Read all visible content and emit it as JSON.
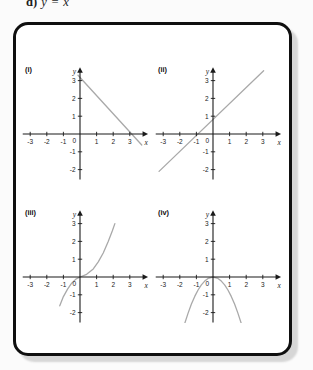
{
  "heading": {
    "prefix": "d)",
    "formula": "y = x"
  },
  "colors": {
    "page_bg": "#fbfbfb",
    "panel_bg": "#ffffff",
    "panel_border": "#0f0f0f",
    "shadow": "#d6d6d6",
    "axis": "#1a1a1a",
    "tick_label": "#222222",
    "curve": "#a9a9a9"
  },
  "chart_data": [
    {
      "id": "i",
      "label": "(i)",
      "type": "line",
      "x_axis_label": "x",
      "y_axis_label": "y",
      "origin_label": "0",
      "x_ticks": [
        -3,
        -2,
        -1,
        1,
        2,
        3
      ],
      "y_ticks": [
        -2,
        -1,
        1,
        2,
        3
      ],
      "x_range": [
        -3.45,
        4.1
      ],
      "y_range": [
        -2.55,
        3.75
      ],
      "grid": false,
      "curve_points": [
        [
          -0.12,
          3.3
        ],
        [
          3.72,
          -0.62
        ]
      ]
    },
    {
      "id": "ii",
      "label": "(ii)",
      "type": "line",
      "x_axis_label": "x",
      "y_axis_label": "y",
      "origin_label": "0",
      "x_ticks": [
        -3,
        -2,
        -1,
        1,
        2,
        3
      ],
      "y_ticks": [
        -2,
        -1,
        1,
        2,
        3
      ],
      "x_range": [
        -3.45,
        4.1
      ],
      "y_range": [
        -2.55,
        3.75
      ],
      "grid": false,
      "curve_points": [
        [
          -3.25,
          -2.1
        ],
        [
          3.05,
          3.55
        ]
      ]
    },
    {
      "id": "iii",
      "label": "(iii)",
      "type": "line",
      "x_axis_label": "x",
      "y_axis_label": "y",
      "origin_label": "0",
      "x_ticks": [
        -3,
        -2,
        -1,
        1,
        2,
        3
      ],
      "y_ticks": [
        -2,
        -1,
        1,
        2,
        3
      ],
      "x_range": [
        -3.45,
        4.1
      ],
      "y_range": [
        -2.55,
        3.75
      ],
      "grid": false,
      "curve_points": [
        [
          -1.22,
          -1.62
        ],
        [
          -1.0,
          -1.1
        ],
        [
          -0.75,
          -0.68
        ],
        [
          -0.5,
          -0.35
        ],
        [
          -0.25,
          -0.12
        ],
        [
          0,
          0
        ],
        [
          0.4,
          0.15
        ],
        [
          0.8,
          0.45
        ],
        [
          1.1,
          0.85
        ],
        [
          1.4,
          1.35
        ],
        [
          1.7,
          2.0
        ],
        [
          1.95,
          2.6
        ],
        [
          2.1,
          3.0
        ]
      ]
    },
    {
      "id": "iv",
      "label": "(iv)",
      "type": "line",
      "x_axis_label": "x",
      "y_axis_label": "y",
      "origin_label": "0",
      "x_ticks": [
        -3,
        -2,
        -1,
        1,
        2,
        3
      ],
      "y_ticks": [
        -2,
        -1,
        1,
        2,
        3
      ],
      "x_range": [
        -3.45,
        4.1
      ],
      "y_range": [
        -2.55,
        3.75
      ],
      "grid": false,
      "curve_points": [
        [
          -1.85,
          -3.08
        ],
        [
          -1.7,
          -2.6
        ],
        [
          -1.5,
          -2.03
        ],
        [
          -1.3,
          -1.52
        ],
        [
          -1.1,
          -1.09
        ],
        [
          -0.9,
          -0.73
        ],
        [
          -0.7,
          -0.44
        ],
        [
          -0.5,
          -0.23
        ],
        [
          -0.3,
          -0.08
        ],
        [
          0,
          0
        ],
        [
          0.3,
          -0.08
        ],
        [
          0.5,
          -0.23
        ],
        [
          0.7,
          -0.44
        ],
        [
          0.9,
          -0.73
        ],
        [
          1.1,
          -1.09
        ],
        [
          1.3,
          -1.52
        ],
        [
          1.5,
          -2.03
        ],
        [
          1.7,
          -2.6
        ],
        [
          1.85,
          -3.08
        ]
      ]
    }
  ]
}
